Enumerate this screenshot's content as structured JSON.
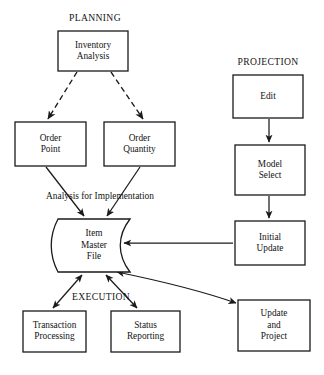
{
  "diagram": {
    "title_groups": [
      {
        "id": "planning",
        "label": "PLANNING",
        "x": 95,
        "y": 21
      },
      {
        "id": "projection",
        "label": "PROJECTION",
        "x": 268,
        "y": 65
      },
      {
        "id": "execution",
        "label": "EXECUTION",
        "x": 101,
        "y": 300
      }
    ],
    "nodes": [
      {
        "id": "inventory-analysis",
        "shape": "rect",
        "x": 58,
        "y": 31,
        "w": 70,
        "h": 40,
        "lines": [
          "Inventory",
          "Analysis"
        ]
      },
      {
        "id": "order-point",
        "shape": "rect",
        "x": 15,
        "y": 122,
        "w": 71,
        "h": 44,
        "lines": [
          "Order",
          "Point"
        ]
      },
      {
        "id": "order-quantity",
        "shape": "rect",
        "x": 104,
        "y": 122,
        "w": 71,
        "h": 44,
        "lines": [
          "Order",
          "Quantity"
        ]
      },
      {
        "id": "item-master-file",
        "shape": "store",
        "x": 58,
        "y": 219,
        "w": 72,
        "h": 53,
        "lines": [
          "Item",
          "Master",
          "File"
        ]
      },
      {
        "id": "transaction-processing",
        "shape": "rect",
        "x": 23,
        "y": 311,
        "w": 63,
        "h": 41,
        "lines": [
          "Transaction",
          "Processing"
        ]
      },
      {
        "id": "status-reporting",
        "shape": "rect",
        "x": 111,
        "y": 311,
        "w": 69,
        "h": 41,
        "lines": [
          "Status",
          "Reporting"
        ]
      },
      {
        "id": "edit",
        "shape": "rect",
        "x": 233,
        "y": 75,
        "w": 70,
        "h": 43,
        "lines": [
          "Edit"
        ]
      },
      {
        "id": "model-select",
        "shape": "rect",
        "x": 235,
        "y": 145,
        "w": 70,
        "h": 50,
        "lines": [
          "Model",
          "Select"
        ]
      },
      {
        "id": "initial-update",
        "shape": "rect",
        "x": 235,
        "y": 221,
        "w": 70,
        "h": 44,
        "lines": [
          "Initial",
          "Update"
        ]
      },
      {
        "id": "update-and-project",
        "shape": "rect",
        "x": 238,
        "y": 300,
        "w": 72,
        "h": 51,
        "lines": [
          "Update",
          "and",
          "Project"
        ]
      }
    ],
    "edge_labels": [
      {
        "id": "analysis-for-implementation",
        "label": "Analysis for Implementation",
        "x": 100,
        "y": 199
      }
    ],
    "edges": [
      {
        "id": "inventory-to-order-point",
        "style": "dashed",
        "arrows": "end",
        "from": "inventory-analysis",
        "to": "order-point",
        "path": "M 77 72 L 48 119"
      },
      {
        "id": "inventory-to-order-quantity",
        "style": "dashed",
        "arrows": "end",
        "from": "inventory-analysis",
        "to": "order-quantity",
        "path": "M 111 72 L 143 119"
      },
      {
        "id": "order-point-to-item-master",
        "style": "solid",
        "arrows": "end",
        "from": "order-point",
        "to": "item-master-file",
        "path": "M 46 167 L 84 216"
      },
      {
        "id": "order-quantity-to-item-master",
        "style": "solid",
        "arrows": "end",
        "from": "order-quantity",
        "to": "item-master-file",
        "path": "M 140 167 L 107 216"
      },
      {
        "id": "item-master-to-transaction",
        "style": "solid",
        "arrows": "both",
        "from": "item-master-file",
        "to": "transaction-processing",
        "path": "M 82 275 L 53 308"
      },
      {
        "id": "item-master-to-status-reporting",
        "style": "solid",
        "arrows": "both",
        "from": "item-master-file",
        "to": "status-reporting",
        "path": "M 106 275 L 137 308"
      },
      {
        "id": "edit-to-model-select",
        "style": "solid",
        "arrows": "end",
        "from": "edit",
        "to": "model-select",
        "path": "M 269 119 L 269 142"
      },
      {
        "id": "model-select-to-initial-update",
        "style": "solid",
        "arrows": "end",
        "from": "model-select",
        "to": "initial-update",
        "path": "M 269 196 L 269 218"
      },
      {
        "id": "initial-update-to-item-master",
        "style": "solid",
        "arrows": "end",
        "from": "initial-update",
        "to": "item-master-file",
        "path": "M 233 243 L 124 243"
      },
      {
        "id": "item-master-to-update-project",
        "style": "solid",
        "arrows": "both",
        "from": "item-master-file",
        "to": "update-and-project",
        "path": "M 117 272 Q 190 287 236 303"
      }
    ],
    "colors": {
      "stroke": "#1a1a1a",
      "fill": "#ffffff",
      "background": "#ffffff",
      "text": "#141414"
    }
  }
}
